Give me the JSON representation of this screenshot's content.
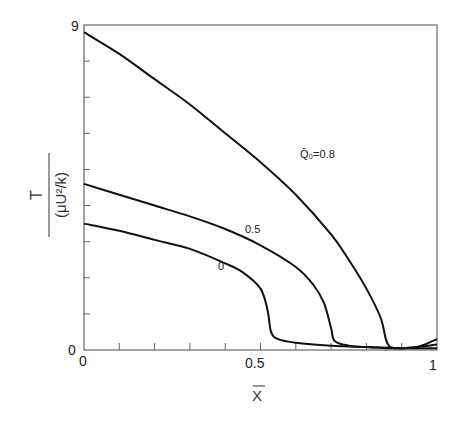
{
  "chart_data": {
    "type": "line",
    "title": "",
    "xlabel": "X̄",
    "ylabel": "T / (μU²/k)",
    "ylabel_numerator": "T",
    "ylabel_denominator": "(μU²/k)",
    "xlim": [
      0,
      1
    ],
    "ylim": [
      0,
      9
    ],
    "x_tick_labels": [
      "0",
      "0.5",
      "1"
    ],
    "y_tick_labels": [
      "0",
      "9"
    ],
    "x_minor_ticks": [
      0.1,
      0.2,
      0.3,
      0.4,
      0.5,
      0.6,
      0.7,
      0.8,
      0.9
    ],
    "y_minor_ticks": [
      1,
      2,
      3,
      4,
      5,
      6,
      7,
      8
    ],
    "grid": false,
    "legend": "inline labels",
    "series": [
      {
        "name": "Q̄₀=0.8",
        "label": "Q̄₀=0.8",
        "x": [
          0,
          0.1,
          0.2,
          0.3,
          0.4,
          0.5,
          0.6,
          0.7,
          0.75,
          0.8,
          0.84,
          0.855,
          0.865,
          0.88,
          0.9,
          0.95,
          1.0
        ],
        "y": [
          8.8,
          8.2,
          7.5,
          6.8,
          6.0,
          5.2,
          4.3,
          3.2,
          2.5,
          1.7,
          0.9,
          0.3,
          0.1,
          0.05,
          0.05,
          0.1,
          0.3
        ]
      },
      {
        "name": "0.5",
        "label": "0.5",
        "x": [
          0,
          0.1,
          0.2,
          0.3,
          0.4,
          0.5,
          0.6,
          0.65,
          0.68,
          0.7,
          0.71,
          0.75,
          0.8,
          0.9,
          1.0
        ],
        "y": [
          4.6,
          4.3,
          4.0,
          3.7,
          3.35,
          2.9,
          2.3,
          1.8,
          1.3,
          0.6,
          0.25,
          0.12,
          0.08,
          0.05,
          0.15
        ]
      },
      {
        "name": "0",
        "label": "0",
        "x": [
          0,
          0.1,
          0.2,
          0.3,
          0.4,
          0.45,
          0.5,
          0.52,
          0.53,
          0.55,
          0.6,
          0.7,
          0.8,
          0.9,
          1.0
        ],
        "y": [
          3.5,
          3.3,
          3.05,
          2.8,
          2.4,
          2.15,
          1.7,
          1.1,
          0.5,
          0.3,
          0.2,
          0.12,
          0.08,
          0.05,
          0.05
        ]
      }
    ]
  },
  "labels": {
    "y_top": "9",
    "y_bottom": "0",
    "x_left": "0",
    "x_mid": "0.5",
    "x_right": "1",
    "x_axis": "X",
    "y_num": "T",
    "y_den": "(μU²/k)",
    "curve_08": "Q̄₀=0.8",
    "curve_05": "0.5",
    "curve_0": "0"
  }
}
